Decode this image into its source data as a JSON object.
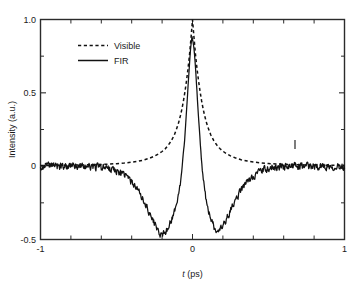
{
  "chart_data": {
    "type": "line",
    "title": "",
    "xlabel": "t (ps)",
    "xlabel_italic_part": "t",
    "xlabel_rest": " (ps)",
    "ylabel": "Intensity (a.u.)",
    "xlim": [
      -1,
      1
    ],
    "ylim": [
      -0.5,
      1.0
    ],
    "grid": false,
    "legend_position": "upper-left-inside",
    "x_ticks_major": [
      -1,
      0,
      1
    ],
    "x_tick_labels": [
      "-1",
      "0",
      "1"
    ],
    "x_ticks_minor": [
      -0.8,
      -0.6,
      -0.4,
      -0.2,
      0.2,
      0.4,
      0.6,
      0.8
    ],
    "y_ticks_major": [
      -0.5,
      0,
      0.5,
      1.0
    ],
    "y_tick_labels": [
      "-0.5",
      "0",
      "0.5",
      "1.0"
    ],
    "series": [
      {
        "name": "Visible",
        "style": "dashed",
        "color": "#111111",
        "description": "Smooth symmetric autocorrelation peak centered at t=0, peak 1.0, decaying to ~0.02 baseline by |t|>0.45",
        "x": [
          -1.0,
          -0.95,
          -0.9,
          -0.85,
          -0.8,
          -0.75,
          -0.7,
          -0.65,
          -0.6,
          -0.55,
          -0.5,
          -0.45,
          -0.4,
          -0.36,
          -0.32,
          -0.28,
          -0.25,
          -0.22,
          -0.2,
          -0.18,
          -0.16,
          -0.14,
          -0.12,
          -0.1,
          -0.09,
          -0.08,
          -0.07,
          -0.06,
          -0.05,
          -0.04,
          -0.03,
          -0.02,
          -0.01,
          0.0,
          0.01,
          0.02,
          0.03,
          0.04,
          0.05,
          0.06,
          0.07,
          0.08,
          0.09,
          0.1,
          0.12,
          0.14,
          0.16,
          0.18,
          0.2,
          0.22,
          0.25,
          0.28,
          0.32,
          0.36,
          0.4,
          0.45,
          0.5,
          0.55,
          0.6,
          0.65,
          0.7,
          0.75,
          0.8,
          0.85,
          0.9,
          0.95,
          1.0
        ],
        "y": [
          0.005,
          0.005,
          0.006,
          0.006,
          0.007,
          0.008,
          0.009,
          0.01,
          0.012,
          0.014,
          0.017,
          0.021,
          0.027,
          0.033,
          0.042,
          0.055,
          0.068,
          0.086,
          0.1,
          0.118,
          0.142,
          0.172,
          0.212,
          0.268,
          0.302,
          0.342,
          0.388,
          0.442,
          0.505,
          0.578,
          0.66,
          0.755,
          0.872,
          1.0,
          0.875,
          0.758,
          0.662,
          0.58,
          0.508,
          0.445,
          0.39,
          0.344,
          0.304,
          0.27,
          0.214,
          0.174,
          0.144,
          0.12,
          0.102,
          0.088,
          0.07,
          0.057,
          0.044,
          0.035,
          0.028,
          0.022,
          0.018,
          0.015,
          0.013,
          0.011,
          0.0095,
          0.0085,
          0.0075,
          0.007,
          0.0065,
          0.006,
          0.006
        ]
      },
      {
        "name": "FIR",
        "style": "solid",
        "color": "#111111",
        "description": "Noisy cross-correlation with narrow peak 1.0 at t=0, deep negative side lobes reaching about -0.47 at t=-0.20 and -0.45 at t=+0.17, noisy baseline near 0 for |t|>0.55",
        "peak_value": 1.0,
        "peak_position": 0.0,
        "left_minimum": {
          "t": -0.2,
          "value": -0.47
        },
        "right_minimum": {
          "t": 0.17,
          "value": -0.45
        },
        "baseline_noise_amplitude": 0.035
      }
    ],
    "annotations": [
      {
        "type": "stray-mark",
        "t": 0.57,
        "value": 0.1,
        "description": "small vertical ink artifact above baseline on right side"
      }
    ]
  },
  "legend": {
    "items": [
      {
        "label": "Visible",
        "style": "dashed"
      },
      {
        "label": "FIR",
        "style": "solid"
      }
    ]
  },
  "axes": {
    "y_label": "Intensity (a.u.)",
    "x_label_italic": "t",
    "x_label_rest": " (ps)",
    "y_tick_labels": [
      "1.0",
      "0.5",
      "0",
      "-0.5"
    ],
    "x_tick_labels": [
      "-1",
      "0",
      "1"
    ]
  },
  "colors": {
    "curve": "#111111",
    "frame": "#2b2b2b",
    "background": "#ffffff",
    "text": "#1a1a1a"
  }
}
